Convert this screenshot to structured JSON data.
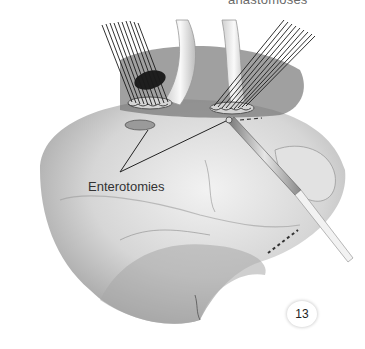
{
  "figure": {
    "top_caption": "anastomoses",
    "label": "Enterotomies",
    "figure_number": "13",
    "colors": {
      "background": "#ffffff",
      "tissue_light": "#e8e8e8",
      "tissue_mid": "#bdbdbd",
      "tissue_dark": "#5a5a5a",
      "suture": "#1a1a1a",
      "text": "#333333"
    }
  }
}
